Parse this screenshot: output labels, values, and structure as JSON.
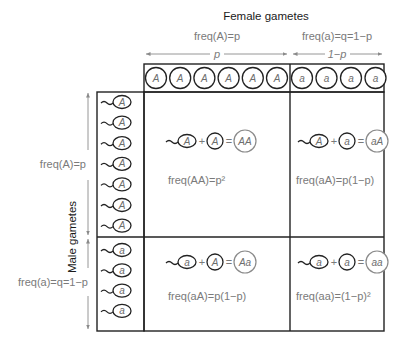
{
  "header": {
    "female_title": "Female gametes",
    "female_A_freq": "freq(A)=p",
    "female_a_freq": "freq(a)=q=1−p",
    "female_A_span": "p",
    "female_a_span": "1−p"
  },
  "side": {
    "male_title": "Male gametes",
    "male_A_freq": "freq(A)=p",
    "male_a_freq": "freq(a)=q=1−p"
  },
  "female_gametes": {
    "A_count": 6,
    "A_label": "A",
    "a_count": 4,
    "a_label": "a"
  },
  "male_gametes": {
    "A_count": 7,
    "A_label": "A",
    "a_count": 4,
    "a_label": "a"
  },
  "cells": [
    {
      "sperm": "A",
      "egg": "A",
      "result": "AA",
      "freq": "freq(AA)=p²"
    },
    {
      "sperm": "A",
      "egg": "a",
      "result": "aA",
      "freq": "freq(aA)=p(1−p)"
    },
    {
      "sperm": "a",
      "egg": "A",
      "result": "Aa",
      "freq": "freq(aA)=p(1−p)"
    },
    {
      "sperm": "a",
      "egg": "a",
      "result": "aa",
      "freq": "freq(aa)=(1−p)²"
    }
  ],
  "colors": {
    "outline": "#222222",
    "label_gray": "#7a7a7a",
    "title_dark": "#1a1a1a"
  }
}
